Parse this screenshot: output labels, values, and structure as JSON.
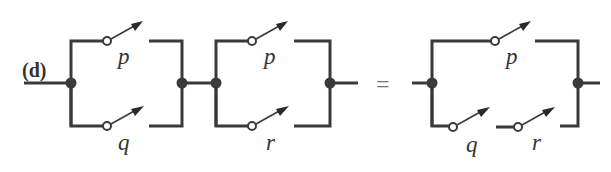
{
  "diagram": {
    "part_label": "(d)",
    "equals_sign": "=",
    "left_expression": {
      "block1": {
        "top_switch": "p",
        "bottom_switch": "q",
        "arrangement": "parallel"
      },
      "block2": {
        "top_switch": "p",
        "bottom_switch": "r",
        "arrangement": "parallel"
      },
      "arrangement": "series"
    },
    "right_expression": {
      "top_switch": "p",
      "bottom_switches": [
        "q",
        "r"
      ],
      "bottom_arrangement": "series",
      "arrangement": "parallel"
    },
    "colors": {
      "wire": "#3a3a3a",
      "background": "#ffffff"
    }
  }
}
